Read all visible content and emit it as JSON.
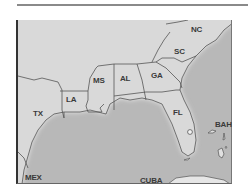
{
  "map": {
    "title": "",
    "colors": {
      "land": "#d9d9d9",
      "water": "#b8b8b8",
      "coast_glow": "#f2f2f2",
      "border": "#555555",
      "label": "#3a3a3a"
    },
    "labels": {
      "nc": "NC",
      "sc": "SC",
      "ga": "GA",
      "al": "AL",
      "ms": "MS",
      "la": "LA",
      "tx": "TX",
      "fl": "FL",
      "bah": "BAH",
      "mex": "MEX",
      "cuba": "CUBA"
    },
    "features": {
      "lake": "Lake Okeechobee"
    }
  }
}
